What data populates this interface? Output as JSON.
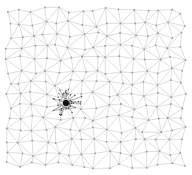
{
  "diagram": {
    "type": "network-graph",
    "width": 192,
    "height": 175,
    "grid": {
      "cols": 15,
      "rows": 14,
      "x0": 8,
      "y0": 12,
      "dx": 12.5,
      "dy": 11.8,
      "jitter": 3.2,
      "seed": 7
    },
    "cluster": {
      "cx": 66,
      "cy": 103,
      "radius": 16,
      "nodes": 45,
      "hub_radius": 3
    },
    "colors": {
      "edge": "#c8c8c8",
      "node": "#9a9a9a",
      "dense_edge": "#8a8a8a",
      "hub": "#111111",
      "background": "#ffffff"
    }
  }
}
